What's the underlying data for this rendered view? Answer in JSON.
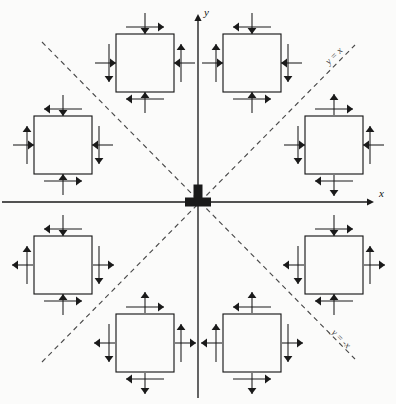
{
  "figure": {
    "background_color": "#fbfbfa",
    "stroke_color": "#1a1a1a",
    "dashed_color": "#4a4a4a",
    "width": 396,
    "height": 404
  },
  "axes": {
    "origin": {
      "x": 198,
      "y": 202
    },
    "x_axis": {
      "label": "x",
      "label_x": 379,
      "label_y": 197,
      "from_x": 2,
      "to_x": 374,
      "y": 202
    },
    "y_axis": {
      "label": "y",
      "label_x": 204,
      "label_y": 16,
      "from_y": 398,
      "to_y": 14,
      "x": 198
    },
    "origin_marker": {
      "shape": "bold-tee",
      "width": 26,
      "height": 9,
      "stem_width": 9,
      "stem_height": 16
    }
  },
  "diagonals": [
    {
      "name": "y = x",
      "label": "y = x",
      "x1": 42,
      "y1": 362,
      "x2": 355,
      "y2": 45,
      "label_x": 336,
      "label_y": 58,
      "rotation": -45,
      "dash": "5 4"
    },
    {
      "name": "y = -x",
      "label": "y = -x",
      "x1": 42,
      "y1": 42,
      "x2": 355,
      "y2": 359,
      "label_x": 339,
      "label_y": 341,
      "rotation": 45,
      "dash": "5 4"
    }
  ],
  "squares": [
    {
      "name": "square-upper-left-of-y-axis",
      "quadrant": "II",
      "cx": 145,
      "cy": 63,
      "size": 58,
      "edges": {
        "top": {
          "normal": "down",
          "shear": "right"
        },
        "bottom": {
          "normal": "up",
          "shear": "left"
        },
        "left": {
          "normal": "right",
          "shear": "down"
        },
        "right": {
          "normal": "left",
          "shear": "up"
        }
      }
    },
    {
      "name": "square-upper-right-of-y-axis",
      "quadrant": "I",
      "cx": 252,
      "cy": 63,
      "size": 58,
      "edges": {
        "top": {
          "normal": "down",
          "shear": "left"
        },
        "bottom": {
          "normal": "up",
          "shear": "right"
        },
        "left": {
          "normal": "right",
          "shear": "up"
        },
        "right": {
          "normal": "left",
          "shear": "down"
        }
      }
    },
    {
      "name": "square-left-upper",
      "quadrant": "II",
      "cx": 63,
      "cy": 145,
      "size": 58,
      "edges": {
        "top": {
          "normal": "down",
          "shear": "left"
        },
        "bottom": {
          "normal": "up",
          "shear": "right"
        },
        "left": {
          "normal": "right",
          "shear": "up"
        },
        "right": {
          "normal": "left",
          "shear": "down"
        }
      }
    },
    {
      "name": "square-right-upper",
      "quadrant": "I",
      "cx": 334,
      "cy": 145,
      "size": 58,
      "edges": {
        "top": {
          "normal": "up",
          "shear": "right"
        },
        "bottom": {
          "normal": "down",
          "shear": "left"
        },
        "left": {
          "normal": "right",
          "shear": "down"
        },
        "right": {
          "normal": "left",
          "shear": "up"
        }
      }
    },
    {
      "name": "square-left-lower",
      "quadrant": "III",
      "cx": 63,
      "cy": 265,
      "size": 58,
      "edges": {
        "top": {
          "normal": "down",
          "shear": "left"
        },
        "bottom": {
          "normal": "up",
          "shear": "right"
        },
        "left": {
          "normal": "left",
          "shear": "up"
        },
        "right": {
          "normal": "right",
          "shear": "down"
        }
      }
    },
    {
      "name": "square-right-lower",
      "quadrant": "IV",
      "cx": 334,
      "cy": 265,
      "size": 58,
      "edges": {
        "top": {
          "normal": "down",
          "shear": "right"
        },
        "bottom": {
          "normal": "up",
          "shear": "left"
        },
        "left": {
          "normal": "left",
          "shear": "down"
        },
        "right": {
          "normal": "right",
          "shear": "up"
        }
      }
    },
    {
      "name": "square-lower-left-of-y-axis",
      "quadrant": "III",
      "cx": 145,
      "cy": 343,
      "size": 58,
      "edges": {
        "top": {
          "normal": "up",
          "shear": "right"
        },
        "bottom": {
          "normal": "down",
          "shear": "left"
        },
        "left": {
          "normal": "left",
          "shear": "down"
        },
        "right": {
          "normal": "right",
          "shear": "up"
        }
      }
    },
    {
      "name": "square-lower-right-of-y-axis",
      "quadrant": "IV",
      "cx": 252,
      "cy": 343,
      "size": 58,
      "edges": {
        "top": {
          "normal": "up",
          "shear": "left"
        },
        "bottom": {
          "normal": "down",
          "shear": "right"
        },
        "left": {
          "normal": "left",
          "shear": "up"
        },
        "right": {
          "normal": "right",
          "shear": "down"
        }
      }
    }
  ],
  "arrow_geometry": {
    "normal_length": 21,
    "shear_length": 38,
    "head_length": 6,
    "head_width": 4.4,
    "offset_from_edge": 5
  }
}
